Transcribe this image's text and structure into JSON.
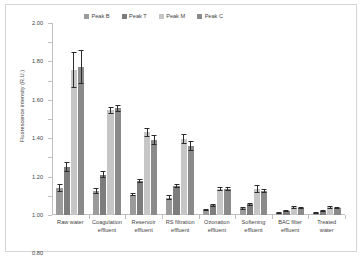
{
  "chart_data": {
    "type": "bar",
    "title": "",
    "xlabel": "",
    "ylabel": "Fluorescence intensity (R.U.)",
    "ylim": [
      0,
      2.0
    ],
    "ytick_step": 0.2,
    "ytick_labels": [
      "0.00",
      "0.20",
      "0.40",
      "0.60",
      "0.80",
      "1.00",
      "1.20",
      "1.40",
      "1.60",
      "1.80",
      "2.00"
    ],
    "grid": false,
    "legend_position": "top-center",
    "categories": [
      "Raw water",
      "Coagulation effluent",
      "Reservoir effluent",
      "RS filtration effluent",
      "Ozonation effluent",
      "Softening effluent",
      "BAC filter effluent",
      "Treated water"
    ],
    "category_lines": [
      [
        "Raw water"
      ],
      [
        "Coagulation",
        "effluent"
      ],
      [
        "Reservoir",
        "effluent"
      ],
      [
        "RS filtration",
        "effluent"
      ],
      [
        "Ozonation",
        "effluent"
      ],
      [
        "Softening",
        "effluent"
      ],
      [
        "BAC filter",
        "effluent"
      ],
      [
        "Treated",
        "water"
      ]
    ],
    "series": [
      {
        "name": "Peak B",
        "color": "#9b9b9b",
        "values": [
          0.28,
          0.25,
          0.21,
          0.18,
          0.05,
          0.07,
          0.02,
          0.02
        ],
        "errors": [
          0.045,
          0.03,
          0.015,
          0.025,
          0.012,
          0.015,
          0.008,
          0.008
        ]
      },
      {
        "name": "Peak T",
        "color": "#7d7d7d",
        "values": [
          0.5,
          0.42,
          0.35,
          0.3,
          0.1,
          0.11,
          0.04,
          0.04
        ],
        "errors": [
          0.055,
          0.035,
          0.02,
          0.022,
          0.018,
          0.017,
          0.012,
          0.012
        ]
      },
      {
        "name": "Peak M",
        "color": "#c6c6c6",
        "values": [
          1.51,
          1.09,
          0.86,
          0.79,
          0.27,
          0.27,
          0.08,
          0.08
        ],
        "errors": [
          0.19,
          0.035,
          0.045,
          0.05,
          0.022,
          0.045,
          0.018,
          0.015
        ]
      },
      {
        "name": "Peak C",
        "color": "#8a8a8a",
        "values": [
          1.54,
          1.11,
          0.78,
          0.72,
          0.27,
          0.25,
          0.07,
          0.07
        ],
        "errors": [
          0.175,
          0.035,
          0.055,
          0.055,
          0.02,
          0.025,
          0.012,
          0.012
        ]
      }
    ]
  }
}
